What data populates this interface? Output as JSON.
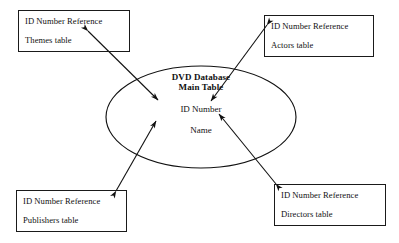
{
  "diagram": {
    "type": "entity-relationship",
    "center": {
      "name": "dvd-database-main-table",
      "title_line1": "DVD Database",
      "title_line2": "Main Table",
      "fields": [
        "ID Number",
        "Name"
      ],
      "shape": "ellipse",
      "stroke": "#111111",
      "fill": "none",
      "bounds": {
        "x": 106,
        "y": 66,
        "width": 190,
        "height": 102
      }
    },
    "boxes": [
      {
        "name": "themes-table-box",
        "heading": "ID Number Reference",
        "table": "Themes table",
        "position": "top-left",
        "bounds": {
          "x": 18,
          "y": 10,
          "width": 112,
          "height": 42
        }
      },
      {
        "name": "actors-table-box",
        "heading": "ID Number Reference",
        "table": "Actors table",
        "position": "top-right",
        "bounds": {
          "x": 264,
          "y": 15,
          "width": 110,
          "height": 42
        }
      },
      {
        "name": "publishers-table-box",
        "heading": "ID Number Reference",
        "table": "Publishers table",
        "position": "bottom-left",
        "bounds": {
          "x": 16,
          "y": 190,
          "width": 111,
          "height": 42
        }
      },
      {
        "name": "directors-table-box",
        "heading": "ID Number Reference",
        "table": "Directors table",
        "position": "bottom-right",
        "bounds": {
          "x": 274,
          "y": 184,
          "width": 112,
          "height": 42
        }
      }
    ],
    "connectors": [
      {
        "name": "connector-themes",
        "from": "themes-table-box",
        "to": "dvd-database-main-table",
        "arrowheads": "both",
        "x1": 88,
        "y1": 31,
        "x2": 158,
        "y2": 100
      },
      {
        "name": "connector-actors",
        "from": "actors-table-box",
        "to": "dvd-database-main-table",
        "arrowheads": "both",
        "x1": 267,
        "y1": 25,
        "x2": 211,
        "y2": 101
      },
      {
        "name": "connector-publishers",
        "from": "publishers-table-box",
        "to": "dvd-database-main-table",
        "arrowheads": "both",
        "x1": 116,
        "y1": 191,
        "x2": 156,
        "y2": 121
      },
      {
        "name": "connector-directors",
        "from": "directors-table-box",
        "to": "dvd-database-main-table",
        "arrowheads": "both",
        "x1": 276,
        "y1": 184,
        "x2": 219,
        "y2": 114
      }
    ],
    "colors": {
      "stroke": "#111111",
      "background": "#ffffff",
      "text": "#111111"
    }
  }
}
